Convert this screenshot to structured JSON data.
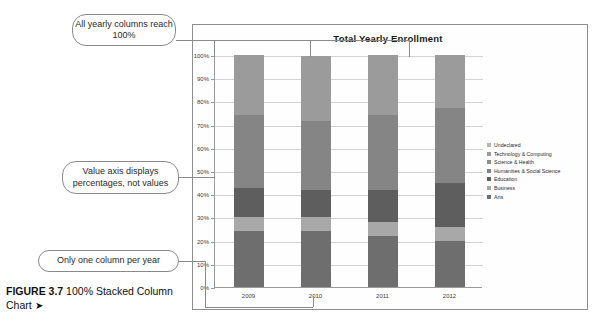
{
  "figure": {
    "label": "FIGURE 3.7",
    "caption": "100% Stacked Column Chart",
    "arrow": "➤"
  },
  "callouts": [
    {
      "name": "all-columns-reach-100",
      "text": "All yearly columns reach 100%"
    },
    {
      "name": "value-axis-percentages",
      "text": "Value axis displays percentages, not values"
    },
    {
      "name": "one-column-per-year",
      "text": "Only one column per year"
    }
  ],
  "chart_data": {
    "type": "bar",
    "subtype": "100% stacked column",
    "title": "Total Yearly Enrollment",
    "xlabel": "",
    "ylabel": "",
    "ylim": [
      0,
      100
    ],
    "grid": true,
    "legend_position": "right",
    "categories": [
      "2009",
      "2010",
      "2011",
      "2012"
    ],
    "ytick_labels": [
      "100%",
      "90%",
      "80%",
      "70%",
      "60%",
      "50%",
      "40%",
      "30%",
      "20%",
      "10%",
      "0%"
    ],
    "ytick_values": [
      100,
      90,
      80,
      70,
      60,
      50,
      40,
      30,
      20,
      10,
      0
    ],
    "series": [
      {
        "name": "Arts",
        "color": "#6e6e6e",
        "values": [
          24,
          24,
          22,
          20
        ]
      },
      {
        "name": "Business",
        "color": "#a8a8a8",
        "values": [
          6,
          6,
          6,
          6
        ]
      },
      {
        "name": "Education",
        "color": "#5e5e5e",
        "values": [
          12.5,
          12,
          14,
          19
        ]
      },
      {
        "name": "Humanities & Social Science",
        "color": "#858585",
        "values": [
          31.5,
          29.5,
          32,
          32
        ]
      },
      {
        "name": "Science & Health",
        "color": "#9b9b9b",
        "values": [
          9,
          10,
          9,
          8
        ]
      },
      {
        "name": "Technology & Computing",
        "color": "#9b9b9b",
        "values": [
          9,
          10,
          9,
          8
        ]
      },
      {
        "name": "Undeclared",
        "color": "#9b9b9b",
        "values": [
          8,
          8,
          8,
          7
        ]
      }
    ],
    "legend_entries": [
      {
        "label": "Undeclared",
        "color": "#b4b4b4"
      },
      {
        "label": "Technology & Computing",
        "color": "#9b9b9b"
      },
      {
        "label": "Science & Health",
        "color": "#8d8d8d"
      },
      {
        "label": "Humanities & Social Science",
        "color": "#858585"
      },
      {
        "label": "Education",
        "color": "#5e5e5e"
      },
      {
        "label": "Business",
        "color": "#a8a8a8"
      },
      {
        "label": "Arts",
        "color": "#6e6e6e"
      }
    ]
  }
}
